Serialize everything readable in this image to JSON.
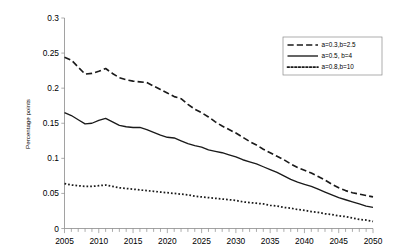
{
  "chart_data": {
    "type": "line",
    "title": "",
    "xlabel": "",
    "ylabel": "Percentage points",
    "xlim": [
      2005,
      2050
    ],
    "ylim": [
      0,
      0.3
    ],
    "grid": false,
    "legend_position": "top-right",
    "y_ticks": [
      "0",
      "0.05",
      "0.1",
      "0.15",
      "0.2",
      "0.25",
      "0.3"
    ],
    "y_tick_values": [
      0,
      0.05,
      0.1,
      0.15,
      0.2,
      0.25,
      0.3
    ],
    "x_ticks": [
      "2005",
      "2010",
      "2015",
      "2020",
      "2025",
      "2030",
      "2035",
      "2040",
      "2045",
      "2050"
    ],
    "x_tick_values": [
      2005,
      2010,
      2015,
      2020,
      2025,
      2030,
      2035,
      2040,
      2045,
      2050
    ],
    "x_minor_tick_step": 1,
    "x": [
      2005,
      2006,
      2007,
      2008,
      2009,
      2010,
      2011,
      2012,
      2013,
      2014,
      2015,
      2016,
      2017,
      2018,
      2019,
      2020,
      2021,
      2022,
      2023,
      2024,
      2025,
      2026,
      2027,
      2028,
      2029,
      2030,
      2031,
      2032,
      2033,
      2034,
      2035,
      2036,
      2037,
      2038,
      2039,
      2040,
      2041,
      2042,
      2043,
      2044,
      2045,
      2046,
      2047,
      2048,
      2049,
      2050
    ],
    "series": [
      {
        "name": "a=0.3,b=2.5",
        "style": "dashed",
        "color": "#1a1a1a",
        "values": [
          0.244,
          0.24,
          0.23,
          0.22,
          0.221,
          0.224,
          0.228,
          0.221,
          0.215,
          0.212,
          0.21,
          0.209,
          0.208,
          0.203,
          0.198,
          0.193,
          0.188,
          0.185,
          0.177,
          0.17,
          0.165,
          0.159,
          0.152,
          0.146,
          0.141,
          0.136,
          0.13,
          0.124,
          0.119,
          0.113,
          0.108,
          0.103,
          0.098,
          0.092,
          0.087,
          0.083,
          0.079,
          0.074,
          0.069,
          0.063,
          0.058,
          0.054,
          0.051,
          0.049,
          0.047,
          0.045
        ]
      },
      {
        "name": "a=0.5, b=4",
        "style": "solid",
        "color": "#1a1a1a",
        "values": [
          0.165,
          0.161,
          0.155,
          0.149,
          0.15,
          0.154,
          0.157,
          0.152,
          0.147,
          0.145,
          0.144,
          0.144,
          0.141,
          0.137,
          0.133,
          0.13,
          0.129,
          0.125,
          0.121,
          0.118,
          0.116,
          0.112,
          0.11,
          0.108,
          0.105,
          0.102,
          0.098,
          0.095,
          0.092,
          0.088,
          0.084,
          0.08,
          0.075,
          0.07,
          0.066,
          0.063,
          0.06,
          0.056,
          0.052,
          0.048,
          0.044,
          0.041,
          0.038,
          0.035,
          0.032,
          0.03
        ]
      },
      {
        "name": "a=0.8,b=10",
        "style": "dotted",
        "color": "#1a1a1a",
        "values": [
          0.064,
          0.062,
          0.061,
          0.06,
          0.06,
          0.061,
          0.062,
          0.06,
          0.058,
          0.057,
          0.056,
          0.055,
          0.054,
          0.053,
          0.052,
          0.051,
          0.05,
          0.049,
          0.048,
          0.046,
          0.045,
          0.044,
          0.043,
          0.042,
          0.041,
          0.04,
          0.038,
          0.037,
          0.036,
          0.035,
          0.033,
          0.032,
          0.03,
          0.029,
          0.027,
          0.026,
          0.024,
          0.023,
          0.021,
          0.02,
          0.018,
          0.017,
          0.015,
          0.013,
          0.012,
          0.01
        ]
      }
    ]
  },
  "legend": {
    "entries": [
      {
        "label": "a=0.3,b=2.5"
      },
      {
        "label": "a=0.5, b=4"
      },
      {
        "label": "a=0.8,b=10"
      }
    ]
  },
  "axes": {
    "y_title": "Percentage points"
  }
}
